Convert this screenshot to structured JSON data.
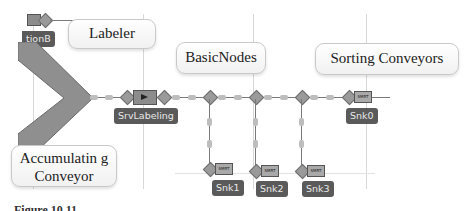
{
  "callouts": {
    "labeler": "Labeler",
    "basic_nodes": "BasicNodes",
    "sorting_conveyors": "Sorting Conveyors",
    "accumulating_conveyor": "Accumulatin g Conveyor"
  },
  "objects": {
    "station_partial": "tionB",
    "server": "SrvLabeling",
    "sinks": [
      "Snk0",
      "Snk1",
      "Snk2",
      "Snk3"
    ],
    "sink_glyph": "SMRT"
  },
  "caption_partial": "Figure 10.11 ...",
  "colors": {
    "node": "#9a9a9a",
    "tag_bg": "#5a5a5a",
    "callout_bg": "#f7f7f7",
    "path": "#7a7a7a"
  }
}
